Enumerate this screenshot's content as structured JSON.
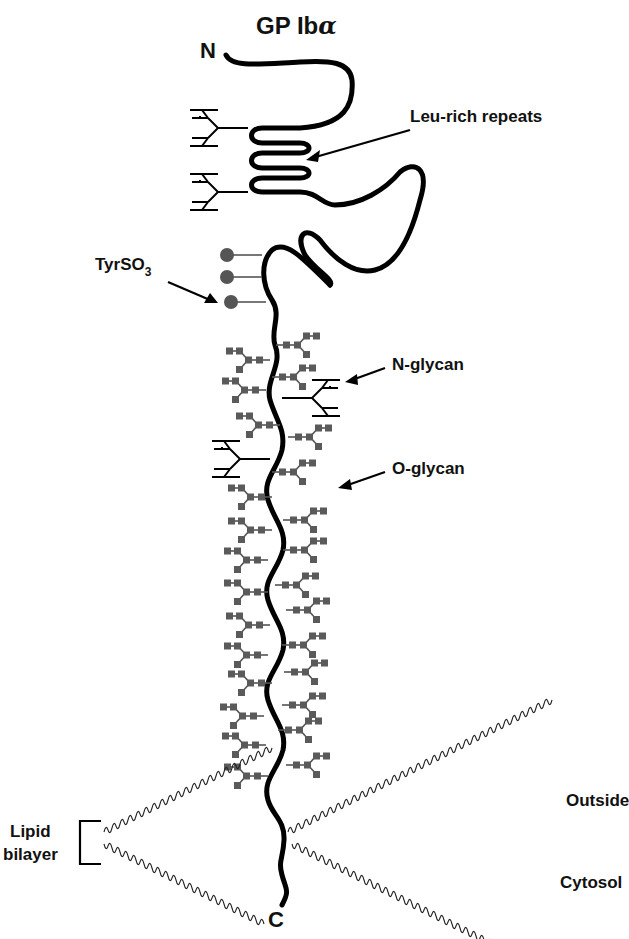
{
  "figure": {
    "title": "GP Ib",
    "title_symbol": "α",
    "terminus_n": "N",
    "terminus_c": "C"
  },
  "labels": {
    "leu_rich": "Leu-rich repeats",
    "tyrso3_main": "TyrSO",
    "tyrso3_sub": "3",
    "n_glycan": "N-glycan",
    "o_glycan": "O-glycan",
    "outside": "Outside",
    "cytosol": "Cytosol",
    "lipid_line1": "Lipid",
    "lipid_line2": "bilayer"
  },
  "colors": {
    "chain": "#000000",
    "glycan": "#5a5a5a",
    "sulfate": "#555555",
    "background": "#ffffff"
  },
  "counts": {
    "leucine_rich_loops": 4,
    "sulfated_tyrosines": 3,
    "n_glycans": 4,
    "o_glycans_approx": 30
  }
}
